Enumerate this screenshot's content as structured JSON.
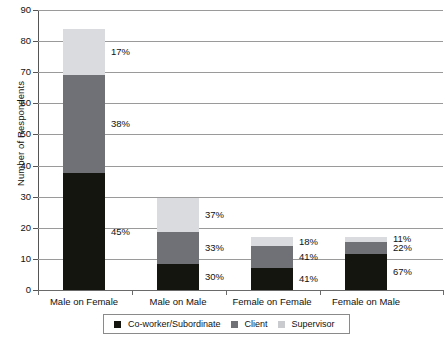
{
  "chart_data": {
    "type": "bar",
    "title": "",
    "xlabel": "",
    "ylabel": "Number of Respondents",
    "ylim": [
      0,
      90
    ],
    "ytick_step": 10,
    "yticks": [
      90,
      80,
      70,
      60,
      50,
      40,
      30,
      20,
      10,
      0
    ],
    "grid": true,
    "stacked": true,
    "legend_position": "bottom",
    "categories": [
      "Male on Female",
      "Male on Male",
      "Female on Female",
      "Female on Male"
    ],
    "series": [
      {
        "name": "Co-worker/Subordinate",
        "color": "#151510",
        "values": [
          37.5,
          8.5,
          7,
          11.5
        ],
        "labels": [
          "45%",
          "30%",
          "41%",
          "67%"
        ]
      },
      {
        "name": "Client",
        "color": "#6f7176",
        "values": [
          31.5,
          10,
          7,
          4
        ],
        "labels": [
          "38%",
          "33%",
          "41%",
          "22%"
        ]
      },
      {
        "name": "Supervisor",
        "color": "#d9dbdf",
        "values": [
          15,
          11,
          3,
          1.5
        ],
        "labels": [
          "17%",
          "37%",
          "18%",
          "11%"
        ]
      }
    ],
    "totals": [
      84,
      29.5,
      17,
      17
    ]
  },
  "legend": {
    "items": [
      {
        "label": "Co-worker/Subordinate",
        "swatch": "sw-cow"
      },
      {
        "label": "Client",
        "swatch": "sw-cli"
      },
      {
        "label": "Supervisor",
        "swatch": "sw-sup"
      }
    ]
  }
}
